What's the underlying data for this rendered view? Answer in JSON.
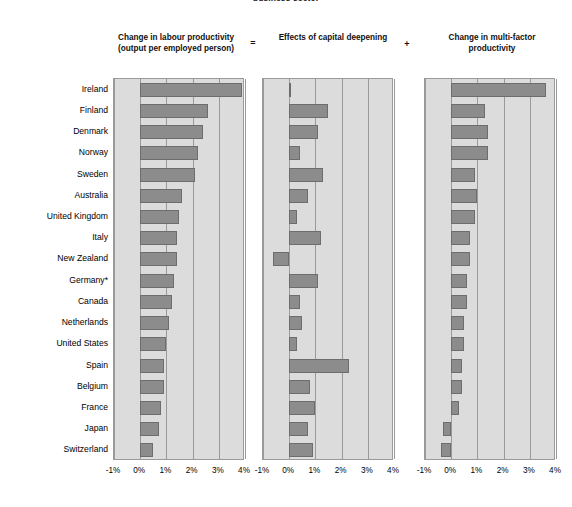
{
  "figure": {
    "suptitle": "business sector",
    "operators": {
      "equals": "=",
      "plus": "+"
    }
  },
  "panels": [
    {
      "key": "labour_productivity",
      "title_line1": "Change in labour productivity",
      "title_line2": "(output per employed person)"
    },
    {
      "key": "capital_deepening",
      "title_line1": "Effects of capital deepening",
      "title_line2": ""
    },
    {
      "key": "multi_factor_productivity",
      "title_line1": "Change in multi-factor",
      "title_line2": "productivity"
    }
  ],
  "axis": {
    "ticks": [
      "-1%",
      "0%",
      "1%",
      "2%",
      "3%",
      "4%"
    ],
    "tick_values": [
      -1,
      0,
      1,
      2,
      3,
      4
    ],
    "xmin": -1,
    "xmax": 4
  },
  "colors": {
    "bar_fill": "#8c8c8c",
    "bar_edge": "#6d6d6d",
    "panel_bg": "#dcdcdc",
    "panel_border": "#9a9a9a",
    "gridline": "#9a9a9a",
    "text": "#000000"
  },
  "chart_data": {
    "type": "bar",
    "title": "business sector",
    "orientation": "horizontal",
    "xlabel": "",
    "ylabel": "",
    "xlim": [
      -1,
      4
    ],
    "xticks": [
      -1,
      0,
      1,
      2,
      3,
      4
    ],
    "xticklabels": [
      "-1%",
      "0%",
      "1%",
      "2%",
      "3%",
      "4%"
    ],
    "grid": true,
    "legend": "none",
    "panel_layout": "three horizontal panels: labour productivity = capital deepening + multi-factor productivity",
    "categories": [
      "Ireland",
      "Finland",
      "Denmark",
      "Norway",
      "Sweden",
      "Australia",
      "United Kingdom",
      "Italy",
      "New Zealand",
      "Germany*",
      "Canada",
      "Netherlands",
      "United States",
      "Spain",
      "Belgium",
      "France",
      "Japan",
      "Switzerland"
    ],
    "series": [
      {
        "name": "Change in labour productivity (output per employed person)",
        "panel": 1,
        "values": [
          3.9,
          2.6,
          2.4,
          2.2,
          2.1,
          1.6,
          1.5,
          1.4,
          1.4,
          1.3,
          1.2,
          1.1,
          1.0,
          0.9,
          0.9,
          0.8,
          0.7,
          0.5
        ]
      },
      {
        "name": "Effects of capital deepening",
        "panel": 2,
        "values": [
          0.0,
          1.5,
          1.1,
          0.4,
          1.3,
          0.7,
          0.3,
          1.2,
          -0.6,
          1.1,
          0.4,
          0.5,
          0.3,
          2.3,
          0.8,
          1.0,
          0.7,
          0.9
        ]
      },
      {
        "name": "Change in multi-factor productivity",
        "panel": 3,
        "values": [
          3.6,
          1.3,
          1.4,
          1.4,
          0.9,
          1.0,
          0.9,
          0.7,
          0.7,
          0.6,
          0.6,
          0.5,
          0.5,
          0.4,
          0.4,
          0.3,
          -0.3,
          -0.4
        ]
      }
    ]
  }
}
